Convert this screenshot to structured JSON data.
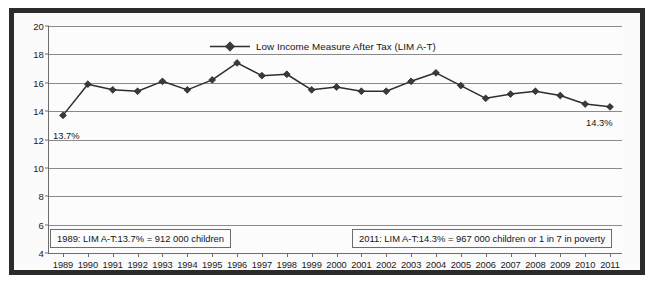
{
  "chart_data": {
    "type": "line",
    "title": "",
    "subtitle": "",
    "xlabel": "",
    "ylabel": "",
    "grid": true,
    "legend_position": "top-center",
    "ylim": [
      4,
      20
    ],
    "yticks": [
      20,
      18,
      16,
      14,
      12,
      10,
      8,
      6,
      4
    ],
    "categories": [
      "1989",
      "1990",
      "1991",
      "1992",
      "1993",
      "1994",
      "1995",
      "1996",
      "1997",
      "1998",
      "1999",
      "2000",
      "2001",
      "2002",
      "2003",
      "2004",
      "2005",
      "2006",
      "2007",
      "2008",
      "2009",
      "2010",
      "2011"
    ],
    "x": [
      1989,
      1990,
      1991,
      1992,
      1993,
      1994,
      1995,
      1996,
      1997,
      1998,
      1999,
      2000,
      2001,
      2002,
      2003,
      2004,
      2005,
      2006,
      2007,
      2008,
      2009,
      2010,
      2011
    ],
    "series": [
      {
        "name": "Low Income Measure After Tax (LIM A-T)",
        "marker": "diamond",
        "color": "#2e2e2e",
        "values": [
          13.7,
          15.9,
          15.5,
          15.4,
          16.1,
          15.5,
          16.2,
          17.4,
          16.5,
          16.6,
          15.5,
          15.7,
          15.4,
          15.4,
          16.1,
          16.7,
          15.8,
          14.9,
          15.2,
          15.4,
          15.1,
          14.5,
          14.3
        ]
      }
    ],
    "annotations": [
      {
        "name": "start-value",
        "text": "13.7%",
        "at_year": 1989
      },
      {
        "name": "end-value",
        "text": "14.3%",
        "at_year": 2011
      },
      {
        "name": "note-1989",
        "text": "1989: LIM A-T:13.7% = 912 000 children"
      },
      {
        "name": "note-2011",
        "text": "2011: LIM A-T:14.3% = 967 000 children or 1 in 7 in poverty"
      }
    ]
  },
  "legend": {
    "label": "Low Income Measure After Tax (LIM A-T)"
  },
  "callouts": {
    "start": "13.7%",
    "end": "14.3%"
  },
  "annotations": {
    "left": "1989: LIM A-T:13.7% = 912 000 children",
    "right": "2011: LIM A-T:14.3% = 967 000 children or 1 in 7 in poverty"
  },
  "colors": {
    "frame": "#2b2b2b",
    "series": "#2e2e2e",
    "grid": "#8a8a8a",
    "axis": "#6d6d6d",
    "plot_background": "#fcfcfc",
    "text": "#141414"
  }
}
